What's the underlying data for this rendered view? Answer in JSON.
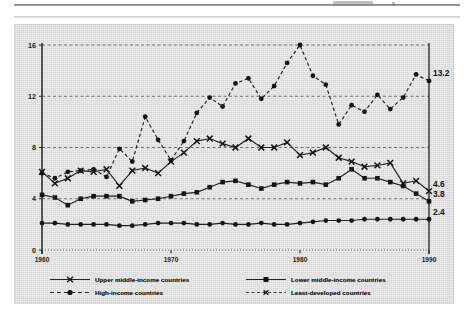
{
  "page": {
    "background_color": "#fefefe",
    "card_color": "#d6d6d6"
  },
  "chart_data": {
    "type": "line",
    "title": "",
    "subtitle": "",
    "xlabel": "",
    "ylabel": "",
    "xlim": [
      1960,
      1990
    ],
    "ylim": [
      0,
      16
    ],
    "yticks": [
      0,
      4,
      8,
      12,
      16
    ],
    "ytick_labels": [
      "0",
      "4",
      "8",
      "12",
      "16"
    ],
    "xticks": [
      1960,
      1970,
      1980,
      1990
    ],
    "xtick_labels": [
      "1960",
      "1970",
      "1980",
      "1990"
    ],
    "grid": true,
    "grid_axis": "y",
    "legend_position": "below",
    "x": [
      1960,
      1961,
      1962,
      1963,
      1964,
      1965,
      1966,
      1967,
      1968,
      1969,
      1970,
      1971,
      1972,
      1973,
      1974,
      1975,
      1976,
      1977,
      1978,
      1979,
      1980,
      1981,
      1982,
      1983,
      1984,
      1985,
      1986,
      1987,
      1988,
      1989,
      1990
    ],
    "series": [
      {
        "name": "High-income countries",
        "marker": "circle",
        "line_style": "dashed",
        "color": "#1f1f1f",
        "end_label": "13.2",
        "values": [
          6.0,
          5.6,
          6.1,
          6.2,
          6.3,
          5.7,
          7.9,
          6.9,
          10.4,
          8.6,
          7.0,
          8.5,
          10.7,
          11.9,
          11.2,
          13.0,
          13.4,
          11.8,
          12.8,
          14.6,
          16.0,
          13.6,
          12.9,
          9.8,
          11.3,
          10.8,
          12.1,
          11.0,
          11.9,
          13.7,
          13.2
        ]
      },
      {
        "name": "Upper middle-income countries",
        "marker": "x",
        "line_style": "solid",
        "color": "#1f1f1f",
        "end_label": "4.6",
        "values": [
          6.1,
          5.2,
          5.6,
          6.2,
          6.1,
          6.3,
          5.0,
          6.2,
          6.4,
          6.0,
          6.9,
          7.6,
          8.5,
          8.7,
          8.3,
          8.0,
          8.7,
          8.0,
          8.0,
          8.4,
          7.4,
          7.6,
          8.0,
          7.2,
          6.9,
          6.5,
          6.6,
          6.8,
          5.2,
          5.4,
          4.6
        ]
      },
      {
        "name": "Lower middle-income countries",
        "marker": "square",
        "line_style": "solid",
        "color": "#1f1f1f",
        "end_label": "3.8",
        "values": [
          4.3,
          4.1,
          3.5,
          4.0,
          4.2,
          4.2,
          4.2,
          3.8,
          3.9,
          4.0,
          4.2,
          4.4,
          4.5,
          4.9,
          5.3,
          5.4,
          5.1,
          4.8,
          5.1,
          5.3,
          5.2,
          5.3,
          5.1,
          5.6,
          6.3,
          5.6,
          5.6,
          5.3,
          5.0,
          4.4,
          3.8
        ]
      },
      {
        "name": "Least-developed countries",
        "marker": "circle",
        "line_style": "solid",
        "color": "#1f1f1f",
        "end_label": "2.4",
        "values": [
          2.1,
          2.1,
          2.0,
          2.0,
          2.0,
          2.0,
          1.9,
          1.9,
          2.0,
          2.1,
          2.1,
          2.1,
          2.0,
          2.0,
          2.1,
          2.0,
          2.0,
          2.1,
          2.0,
          2.0,
          2.1,
          2.2,
          2.3,
          2.3,
          2.3,
          2.4,
          2.4,
          2.4,
          2.4,
          2.4,
          2.4
        ]
      }
    ],
    "end_labels": [
      "13.2",
      "4.6",
      "3.8",
      "2.4"
    ]
  },
  "legend": {
    "rows": [
      {
        "left": "Upper middle-income countries",
        "right": "Lower middle-income countries"
      },
      {
        "left": "High-income countries",
        "right": "Least-developed countries"
      }
    ]
  }
}
